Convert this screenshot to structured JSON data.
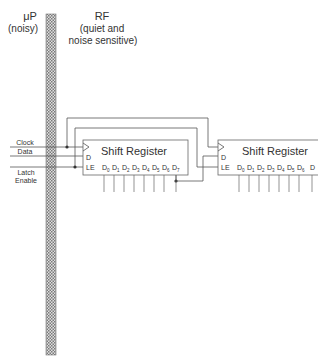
{
  "regions": {
    "left": {
      "title": "μP",
      "subtitle": "(noisy)"
    },
    "right": {
      "title": "RF",
      "subtitle_line1": "(quiet and",
      "subtitle_line2": "noise sensitive)"
    }
  },
  "signals": {
    "clock": "Clock",
    "data": "Data",
    "latch_line1": "Latch",
    "latch_line2": "Enable"
  },
  "registers": [
    {
      "title": "Shift Register",
      "pin_d": "D",
      "pin_le": "LE",
      "outputs": [
        "D",
        "D",
        "D",
        "D",
        "D",
        "D",
        "D",
        "D"
      ],
      "output_subs": [
        "0",
        "1",
        "2",
        "3",
        "4",
        "5",
        "6",
        "7"
      ]
    },
    {
      "title": "Shift Register",
      "pin_d": "D",
      "pin_le": "LE",
      "outputs": [
        "D",
        "D",
        "D",
        "D",
        "D",
        "D",
        "D",
        "D"
      ],
      "output_subs": [
        "0",
        "1",
        "2",
        "3",
        "4",
        "5",
        "6",
        "7"
      ]
    }
  ],
  "colors": {
    "line": "#555555",
    "text": "#333333",
    "hatch": "#8a8a8a"
  }
}
